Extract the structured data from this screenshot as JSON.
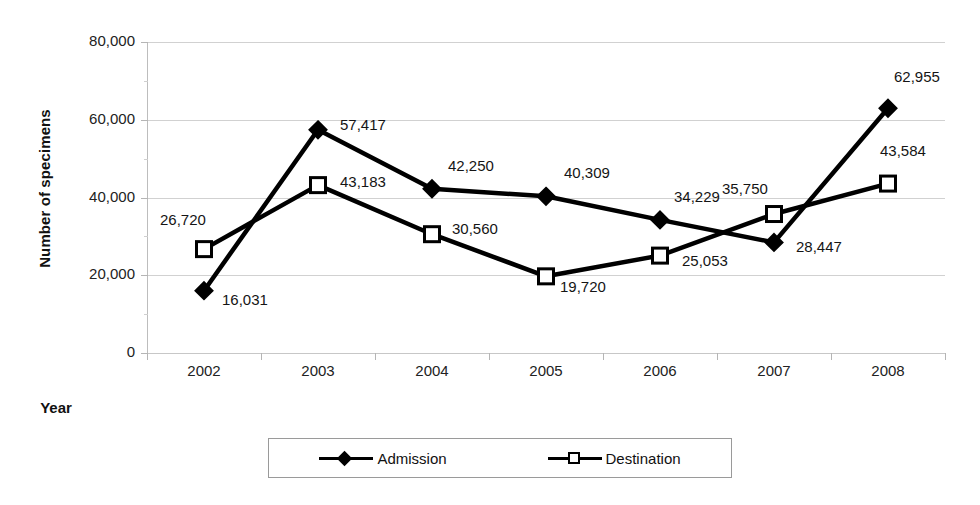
{
  "chart_data": {
    "type": "line",
    "title": "",
    "xlabel": "Year",
    "ylabel": "Number of specimens",
    "categories": [
      "2002",
      "2003",
      "2004",
      "2005",
      "2006",
      "2007",
      "2008"
    ],
    "ylim": [
      0,
      80000
    ],
    "yticks": [
      0,
      20000,
      40000,
      60000,
      80000
    ],
    "ytick_labels": [
      "0",
      "20,000",
      "40,000",
      "60,000",
      "80,000"
    ],
    "grid": true,
    "legend_position": "bottom",
    "series": [
      {
        "name": "Admission",
        "marker": "filled-diamond",
        "color": "#000000",
        "values": [
          16031,
          57417,
          42250,
          40309,
          34229,
          28447,
          62955
        ],
        "value_labels": [
          "16,031",
          "57,417",
          "42,250",
          "40,309",
          "34,229",
          "28,447",
          "62,955"
        ]
      },
      {
        "name": "Destination",
        "marker": "open-square",
        "color": "#000000",
        "values": [
          26720,
          43183,
          30560,
          19720,
          25053,
          35750,
          43584
        ],
        "value_labels": [
          "26,720",
          "43,183",
          "30,560",
          "19,720",
          "25,053",
          "35,750",
          "43,584"
        ]
      }
    ]
  },
  "legend": {
    "items": [
      {
        "label": "Admission",
        "marker": "filled-diamond"
      },
      {
        "label": "Destination",
        "marker": "open-square"
      }
    ]
  },
  "colors": {
    "series": "#000000",
    "gridline": "#c9c9c9",
    "axis": "#bdbdbd",
    "text": "#151515",
    "background": "#ffffff"
  }
}
